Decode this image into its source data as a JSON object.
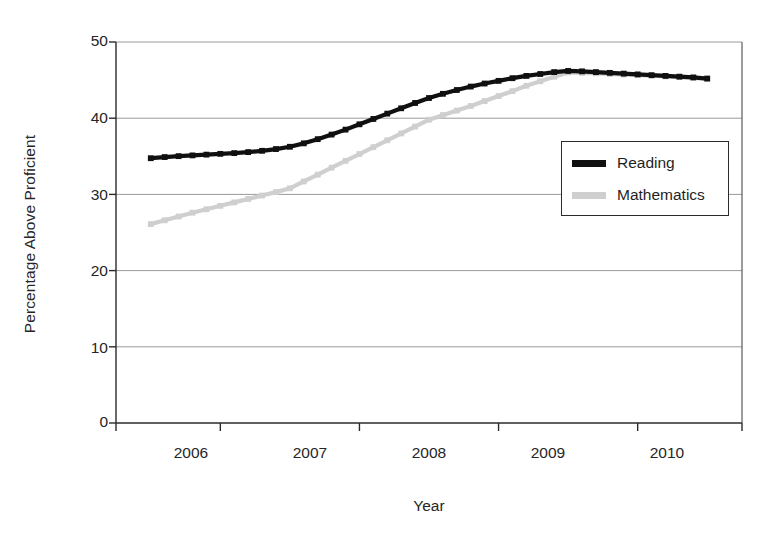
{
  "chart_data": {
    "type": "line",
    "title": "",
    "xlabel": "Year",
    "ylabel": "Percentage Above Proficient",
    "x": [
      2006,
      2007,
      2008,
      2009,
      2010
    ],
    "xlim": [
      2005.75,
      2010.25
    ],
    "ylim": [
      0,
      50
    ],
    "yticks": [
      0,
      10,
      20,
      30,
      40,
      50
    ],
    "xticks": [
      2006,
      2007,
      2008,
      2009,
      2010
    ],
    "grid": "horizontal",
    "legend_position": "center-right",
    "series": [
      {
        "name": "Reading",
        "color": "#101010",
        "marker": "square",
        "values": [
          34.8,
          36.2,
          43.0,
          46.2,
          45.2
        ]
      },
      {
        "name": "Mathematics",
        "color": "#cccccc",
        "marker": "square",
        "values": [
          26.1,
          30.8,
          39.8,
          46.0,
          45.2
        ]
      }
    ],
    "series_dense": [
      {
        "name": "Reading",
        "points": [
          [
            2006.0,
            34.75
          ],
          [
            2006.1,
            34.9
          ],
          [
            2006.2,
            35.02
          ],
          [
            2006.3,
            35.12
          ],
          [
            2006.4,
            35.22
          ],
          [
            2006.5,
            35.32
          ],
          [
            2006.6,
            35.42
          ],
          [
            2006.7,
            35.55
          ],
          [
            2006.8,
            35.72
          ],
          [
            2006.9,
            35.95
          ],
          [
            2007.0,
            36.25
          ],
          [
            2007.1,
            36.7
          ],
          [
            2007.2,
            37.25
          ],
          [
            2007.3,
            37.85
          ],
          [
            2007.4,
            38.5
          ],
          [
            2007.5,
            39.2
          ],
          [
            2007.6,
            39.9
          ],
          [
            2007.7,
            40.6
          ],
          [
            2007.8,
            41.3
          ],
          [
            2007.9,
            42.0
          ],
          [
            2008.0,
            42.65
          ],
          [
            2008.1,
            43.2
          ],
          [
            2008.2,
            43.7
          ],
          [
            2008.3,
            44.15
          ],
          [
            2008.4,
            44.55
          ],
          [
            2008.5,
            44.9
          ],
          [
            2008.6,
            45.25
          ],
          [
            2008.7,
            45.55
          ],
          [
            2008.8,
            45.8
          ],
          [
            2008.9,
            46.05
          ],
          [
            2009.0,
            46.2
          ],
          [
            2009.1,
            46.15
          ],
          [
            2009.2,
            46.05
          ],
          [
            2009.3,
            45.95
          ],
          [
            2009.4,
            45.85
          ],
          [
            2009.5,
            45.75
          ],
          [
            2009.6,
            45.65
          ],
          [
            2009.7,
            45.55
          ],
          [
            2009.8,
            45.45
          ],
          [
            2009.9,
            45.35
          ],
          [
            2010.0,
            45.2
          ]
        ]
      },
      {
        "name": "Mathematics",
        "points": [
          [
            2006.0,
            26.1
          ],
          [
            2006.1,
            26.6
          ],
          [
            2006.2,
            27.1
          ],
          [
            2006.3,
            27.6
          ],
          [
            2006.4,
            28.05
          ],
          [
            2006.5,
            28.5
          ],
          [
            2006.6,
            28.95
          ],
          [
            2006.7,
            29.4
          ],
          [
            2006.8,
            29.85
          ],
          [
            2006.9,
            30.3
          ],
          [
            2007.0,
            30.8
          ],
          [
            2007.1,
            31.7
          ],
          [
            2007.2,
            32.6
          ],
          [
            2007.3,
            33.5
          ],
          [
            2007.4,
            34.4
          ],
          [
            2007.5,
            35.3
          ],
          [
            2007.6,
            36.2
          ],
          [
            2007.7,
            37.1
          ],
          [
            2007.8,
            38.0
          ],
          [
            2007.9,
            38.9
          ],
          [
            2008.0,
            39.8
          ],
          [
            2008.1,
            40.4
          ],
          [
            2008.2,
            41.0
          ],
          [
            2008.3,
            41.6
          ],
          [
            2008.4,
            42.25
          ],
          [
            2008.5,
            42.9
          ],
          [
            2008.6,
            43.55
          ],
          [
            2008.7,
            44.25
          ],
          [
            2008.8,
            44.85
          ],
          [
            2008.9,
            45.45
          ],
          [
            2009.0,
            46.0
          ],
          [
            2009.1,
            45.95
          ],
          [
            2009.2,
            45.88
          ],
          [
            2009.3,
            45.8
          ],
          [
            2009.4,
            45.72
          ],
          [
            2009.5,
            45.65
          ],
          [
            2009.6,
            45.57
          ],
          [
            2009.7,
            45.48
          ],
          [
            2009.8,
            45.4
          ],
          [
            2009.9,
            45.3
          ],
          [
            2010.0,
            45.2
          ]
        ]
      }
    ]
  },
  "axis": {
    "ylabel": "Percentage Above Proficient",
    "xlabel": "Year",
    "ytick_labels": [
      "50",
      "40",
      "30",
      "20",
      "10",
      "0"
    ],
    "xtick_labels": [
      "2006",
      "2007",
      "2008",
      "2009",
      "2010"
    ]
  },
  "legend": {
    "items": [
      {
        "label": "Reading",
        "color": "#101010"
      },
      {
        "label": "Mathematics",
        "color": "#cfcfcf"
      }
    ]
  },
  "colors": {
    "reading": "#101010",
    "mathematics": "#cfcfcf",
    "grid": "#9a9a9a",
    "axis": "#2b2b2b",
    "background": "#ffffff"
  }
}
